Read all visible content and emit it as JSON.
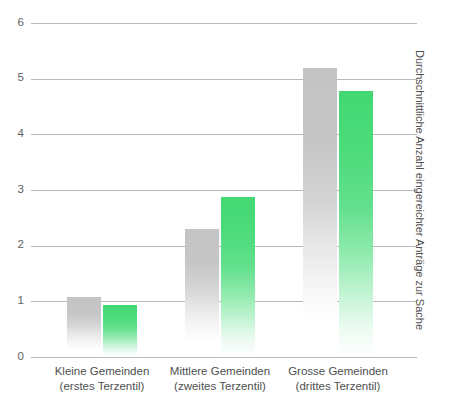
{
  "chart_data": {
    "type": "bar",
    "title": "",
    "xlabel": "",
    "ylabel": "Durchschnittliche Anzahl eingereichter Anträge zur Sache",
    "ylim": [
      0,
      6
    ],
    "yticks": [
      "0",
      "1",
      "2",
      "3",
      "4",
      "5",
      "6"
    ],
    "grid": true,
    "legend": "none",
    "categories": [
      "Kleine Gemeinden (erstes Terzentil)",
      "Mittlere Gemeinden (zweites Terzentil)",
      "Grosse Gemeinden (drittes Terzentil)"
    ],
    "category_lines": [
      {
        "line1": "Kleine Gemeinden",
        "line2": "(erstes Terzentil)"
      },
      {
        "line1": "Mittlere Gemeinden",
        "line2": "(zweites Terzentil)"
      },
      {
        "line1": "Grosse Gemeinden",
        "line2": "(drittes Terzentil)"
      }
    ],
    "series": [
      {
        "name": "grau",
        "color": "#C6C6C6",
        "values": [
          1.08,
          2.3,
          5.2
        ]
      },
      {
        "name": "gruen",
        "color": "#4CDB7B",
        "values": [
          0.93,
          2.87,
          4.77
        ]
      }
    ]
  },
  "axis": {
    "tick_0": "0",
    "tick_1": "1",
    "tick_2": "2",
    "tick_3": "3",
    "tick_4": "4",
    "tick_5": "5",
    "tick_6": "6",
    "vertical_title": "Durchschnittliche Anzahl eingereichter Anträge zur Sache"
  },
  "categories": {
    "c0_line1": "Kleine Gemeinden",
    "c0_line2": "(erstes Terzentil)",
    "c1_line1": "Mittlere Gemeinden",
    "c1_line2": "(zweites Terzentil)",
    "c2_line1": "Grosse Gemeinden",
    "c2_line2": "(drittes Terzentil)"
  },
  "colors": {
    "gray_bar": "#C6C6C6",
    "green_bar": "#4CDB7B",
    "gridline": "#B9B9B9",
    "text": "#4F4F4F",
    "background": "#FFFFFF"
  }
}
